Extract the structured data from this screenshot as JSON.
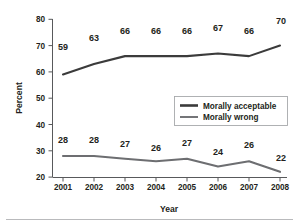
{
  "chart_data": {
    "type": "line",
    "title": "",
    "xlabel": "Year",
    "ylabel": "Percent",
    "categories": [
      "2001",
      "2002",
      "2003",
      "2004",
      "2005",
      "2006",
      "2007",
      "2008"
    ],
    "x": [
      2001,
      2002,
      2003,
      2004,
      2005,
      2006,
      2007,
      2008
    ],
    "ylim": [
      20,
      80
    ],
    "yticks": [
      "20",
      "30",
      "40",
      "50",
      "60",
      "70",
      "80"
    ],
    "ytick_values": [
      20,
      30,
      40,
      50,
      60,
      70,
      80
    ],
    "grid": false,
    "legend_position": "center-right",
    "series": [
      {
        "name": "Morally acceptable",
        "values": [
          59,
          63,
          66,
          66,
          66,
          67,
          66,
          70
        ],
        "labels": [
          "59",
          "63",
          "66",
          "66",
          "66",
          "67",
          "66",
          "70"
        ],
        "color": "#3b3b3b"
      },
      {
        "name": "Morally wrong",
        "values": [
          28,
          28,
          27,
          26,
          27,
          24,
          26,
          22
        ],
        "labels": [
          "28",
          "28",
          "27",
          "26",
          "27",
          "24",
          "26",
          "22"
        ],
        "color": "#6d6e71"
      }
    ]
  },
  "axes": {
    "y_title": "Percent",
    "x_title": "Year"
  },
  "legend": {
    "entries": [
      {
        "label": "Morally acceptable"
      },
      {
        "label": "Morally wrong"
      }
    ]
  },
  "colors": {
    "series_primary": "#3b3b3b",
    "series_secondary": "#6d6e71",
    "axis": "#58595b",
    "text": "#231f20",
    "background": "#ffffff",
    "legend_border": "#a7a9ac",
    "footer_rule": "#b9babc"
  }
}
